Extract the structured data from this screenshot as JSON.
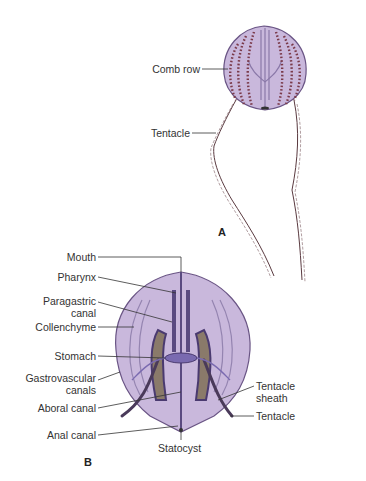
{
  "figure": {
    "panel_a": {
      "letter": "A",
      "labels": {
        "comb_row": "Comb row",
        "tentacle": "Tentacle"
      }
    },
    "panel_b": {
      "letter": "B",
      "labels": {
        "mouth": "Mouth",
        "pharynx": "Pharynx",
        "paragastric_1": "Paragastric",
        "paragastric_2": "canal",
        "collenchyme": "Collenchyme",
        "stomach": "Stomach",
        "gastro_1": "Gastrovascular",
        "gastro_2": "canals",
        "aboral_canal": "Aboral canal",
        "anal_canal": "Anal canal",
        "statocyst": "Statocyst",
        "sheath_1": "Tentacle",
        "sheath_2": "sheath",
        "tentacle": "Tentacle"
      }
    },
    "colors": {
      "body_fill": "#c9b8dc",
      "body_stroke": "#6a5585",
      "canal": "#5a4a80",
      "comb_dots": "#7a3a4a",
      "tentacle": "#5a3a40",
      "leader": "#333333"
    }
  }
}
